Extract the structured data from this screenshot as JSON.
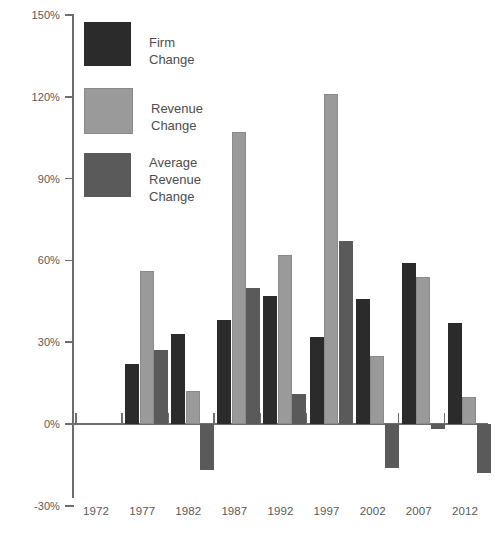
{
  "chart_data": {
    "type": "bar",
    "title": "",
    "xlabel": "",
    "ylabel": "",
    "ylim": [
      -30,
      150
    ],
    "yticks": [
      150,
      120,
      90,
      60,
      30,
      0,
      -30
    ],
    "ytick_labels": [
      "150%",
      "120%",
      "90%",
      "60%",
      "30%",
      "0%",
      "-30%"
    ],
    "grid": false,
    "legend_position": "top-left",
    "categories": [
      "1972",
      "1977",
      "1982",
      "1987",
      "1992",
      "1997",
      "2002",
      "2007",
      "2012"
    ],
    "series": [
      {
        "name": "Firm Change",
        "color": "#2b2b2b",
        "values": [
          null,
          22,
          33,
          38,
          47,
          32,
          46,
          59,
          37
        ]
      },
      {
        "name": "Revenue Change",
        "color": "#9a9a9a",
        "values": [
          null,
          56,
          12,
          107,
          62,
          121,
          25,
          54,
          10
        ]
      },
      {
        "name": "Average Revenue Change",
        "color": "#5a5a5a",
        "values": [
          null,
          27,
          -17,
          50,
          11,
          67,
          -16,
          -2,
          -18
        ]
      }
    ]
  },
  "legend": {
    "items": [
      {
        "label": "Firm Change",
        "swatch": "firm"
      },
      {
        "label": "Revenue Change",
        "swatch": "revenue"
      },
      {
        "label": "Average\nRevenue\nChange",
        "swatch": "avgrev"
      }
    ]
  },
  "axis": {
    "y_labels": [
      "150%",
      "120%",
      "90%",
      "60%",
      "30%",
      "0%",
      "-30%"
    ],
    "x_labels": [
      "1972",
      "1977",
      "1982",
      "1987",
      "1992",
      "1997",
      "2002",
      "2007",
      "2012"
    ]
  }
}
